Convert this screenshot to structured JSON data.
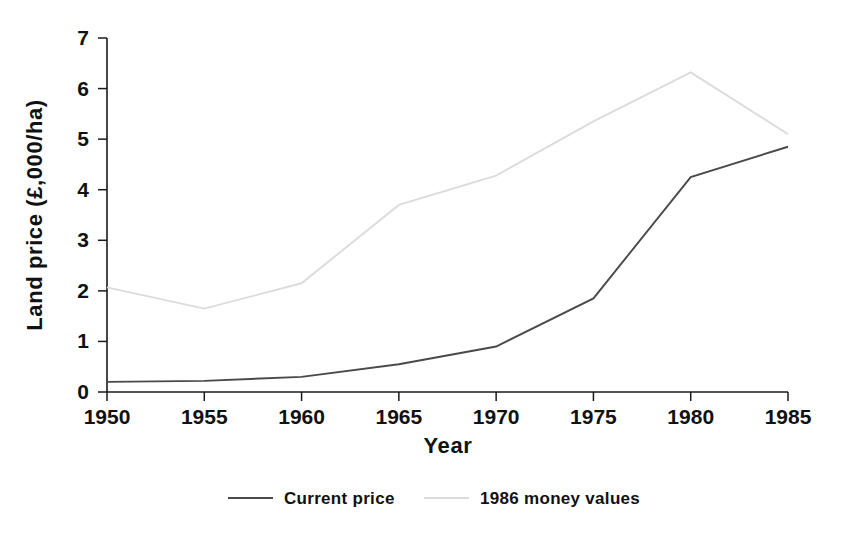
{
  "chart_data": {
    "type": "line",
    "title": "",
    "xlabel": "Year",
    "ylabel": "Land price (£,000/ha)",
    "x": [
      1950,
      1955,
      1960,
      1965,
      1970,
      1975,
      1980,
      1985
    ],
    "xtick_labels": [
      "1950",
      "1955",
      "1960",
      "1965",
      "1970",
      "1975",
      "1980",
      "1985"
    ],
    "ytick_labels": [
      "0",
      "1",
      "2",
      "3",
      "4",
      "5",
      "6",
      "7"
    ],
    "xlim": [
      1950,
      1985
    ],
    "ylim": [
      0,
      7
    ],
    "grid": false,
    "legend_position": "below",
    "series": [
      {
        "name": "Current price",
        "color": "#4a4a4a",
        "values": [
          0.2,
          0.22,
          0.3,
          0.55,
          0.9,
          1.85,
          4.25,
          4.85
        ]
      },
      {
        "name": "1986 money values",
        "color": "#dcdcdc",
        "values": [
          2.07,
          1.65,
          2.15,
          3.7,
          4.28,
          5.35,
          6.32,
          5.1
        ]
      }
    ]
  },
  "legend": {
    "entries": [
      {
        "label": "Current price",
        "swatch": "line-swatch-dark"
      },
      {
        "label": "1986 money values",
        "swatch": "line-swatch-light"
      }
    ]
  }
}
